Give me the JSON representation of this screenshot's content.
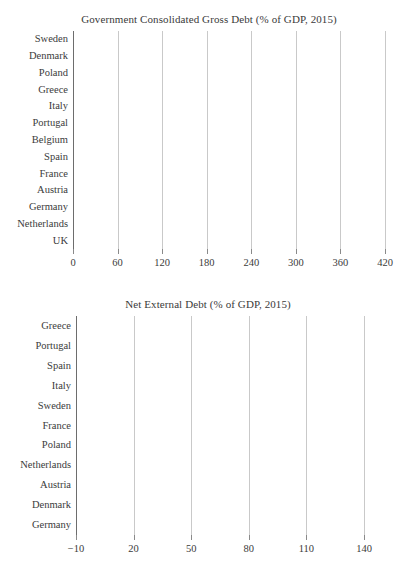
{
  "chart_data": [
    {
      "type": "bar",
      "orientation": "horizontal",
      "title": "Government Consolidated Gross Debt (% of GDP, 2015)",
      "xlabel": "",
      "ylabel": "",
      "xlim": [
        0,
        420
      ],
      "xticks": [
        "0",
        "60",
        "120",
        "180",
        "240",
        "300",
        "360",
        "420"
      ],
      "xtick_values": [
        0,
        60,
        120,
        180,
        240,
        300,
        360,
        420
      ],
      "grid": true,
      "legend": false,
      "bar_color": "#848484",
      "categories": [
        "Sweden",
        "Denmark",
        "Poland",
        "Greece",
        "Italy",
        "Portugal",
        "Belgium",
        "Spain",
        "France",
        "Austria",
        "Germany",
        "Netherlands",
        "UK"
      ],
      "values": [
        411,
        294,
        220,
        177,
        128,
        125,
        105,
        99,
        96,
        84,
        68,
        64,
        63
      ]
    },
    {
      "type": "bar",
      "orientation": "horizontal",
      "title": "Net External Debt (% of GDP, 2015)",
      "xlabel": "",
      "ylabel": "",
      "xlim": [
        -10,
        140
      ],
      "xticks": [
        "−10",
        "20",
        "50",
        "80",
        "110",
        "140"
      ],
      "xtick_values": [
        -10,
        20,
        50,
        80,
        110,
        140
      ],
      "grid": true,
      "legend": false,
      "bar_color": "#1d1d1d",
      "categories": [
        "Greece",
        "Portugal",
        "Spain",
        "Italy",
        "Sweden",
        "France",
        "Poland",
        "Netherlands",
        "Austria",
        "Denmark",
        "Germany"
      ],
      "values": [
        138,
        101,
        93,
        59,
        46,
        38,
        36,
        41,
        20,
        3.5,
        -10
      ]
    }
  ]
}
